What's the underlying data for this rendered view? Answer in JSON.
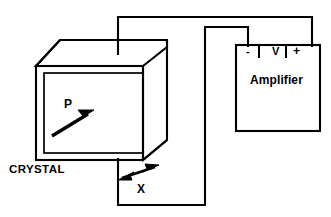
{
  "figure": {
    "type": "piezoelectric-crystal-amplifier-schematic",
    "background_color": "#ffffff",
    "line_color": "#000000"
  },
  "crystal": {
    "label": "CRYSTAL",
    "polarization_label": "P",
    "polarization_arrow": "single-headed-arrow-up-right",
    "strain_label": "X",
    "strain_arrow": "double-headed-arrow-up-right"
  },
  "amplifier": {
    "label": "Amplifier",
    "terminals": [
      {
        "name": "negative-terminal",
        "label": "-"
      },
      {
        "name": "voltage-terminal",
        "label": "V"
      },
      {
        "name": "positive-terminal",
        "label": "+"
      }
    ]
  },
  "wiring": {
    "top_lead": "crystal-top-electrode-to-positive-terminal",
    "bottom_lead": "crystal-bottom-electrode-to-negative-terminal"
  }
}
